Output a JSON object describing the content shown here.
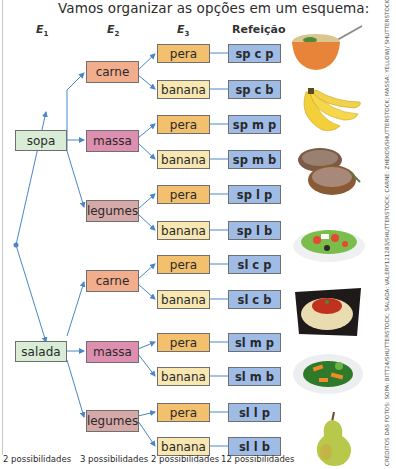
{
  "title": "Vamos organizar as opções em um esquema:",
  "headers": {
    "e1": {
      "label": "E",
      "sub": "1"
    },
    "e2": {
      "label": "E",
      "sub": "2"
    },
    "e3": {
      "label": "E",
      "sub": "3"
    },
    "meal": "Refeição"
  },
  "tree": {
    "e1": [
      {
        "label": "sopa"
      },
      {
        "label": "salada"
      }
    ],
    "e2": [
      {
        "label": "carne"
      },
      {
        "label": "massa"
      },
      {
        "label": "legumes"
      },
      {
        "label": "carne"
      },
      {
        "label": "massa"
      },
      {
        "label": "legumes"
      }
    ],
    "e3": [
      {
        "label": "pera",
        "meal": "sp c p"
      },
      {
        "label": "banana",
        "meal": "sp c b"
      },
      {
        "label": "pera",
        "meal": "sp m p"
      },
      {
        "label": "banana",
        "meal": "sp m b"
      },
      {
        "label": "pera",
        "meal": "sp l p"
      },
      {
        "label": "banana",
        "meal": "sp l b"
      },
      {
        "label": "pera",
        "meal": "sl c p"
      },
      {
        "label": "banana",
        "meal": "sl c b"
      },
      {
        "label": "pera",
        "meal": "sl m p"
      },
      {
        "label": "banana",
        "meal": "sl m b"
      },
      {
        "label": "pera",
        "meal": "sl l p"
      },
      {
        "label": "banana",
        "meal": "sl l b"
      }
    ]
  },
  "footer": {
    "e1": "2 possibilidades",
    "e2": "3 possibilidades",
    "e3": "2 possibilidades",
    "meal": "12 possibilidades"
  },
  "photos": [
    "soup-bowl",
    "bananas",
    "grilled-meat",
    "salad-plate",
    "pasta-plate",
    "vegetables-plate",
    "pear"
  ],
  "colors": {
    "line": "#4a86c8",
    "e1": "#d8ecd6",
    "carne": "#f2ad8c",
    "massa": "#de8fb0",
    "legumes": "#d6a9a9",
    "pera": "#f3c06e",
    "banana": "#f8e7b1",
    "meal": "#9fbce7"
  },
  "credits": "CRÉDITOS DAS FOTOS: SOPA: BITT24/SHUTTERSTOCK; SALADA: VALERY121283/SHUTTERSTOCK; CARNE: ZHEKOS/SHUTTERSTOCK; MASSA: YELLOWJ/ SHUTTERSTOCK; LEGUMES: SIAMIONAU PAVEL/SHUTTERSTOCK; PERA: BERGAMONT/SHUTTERSTOCK; BANANA: MAKS NARODENKO/SHUTTERSTOCK"
}
